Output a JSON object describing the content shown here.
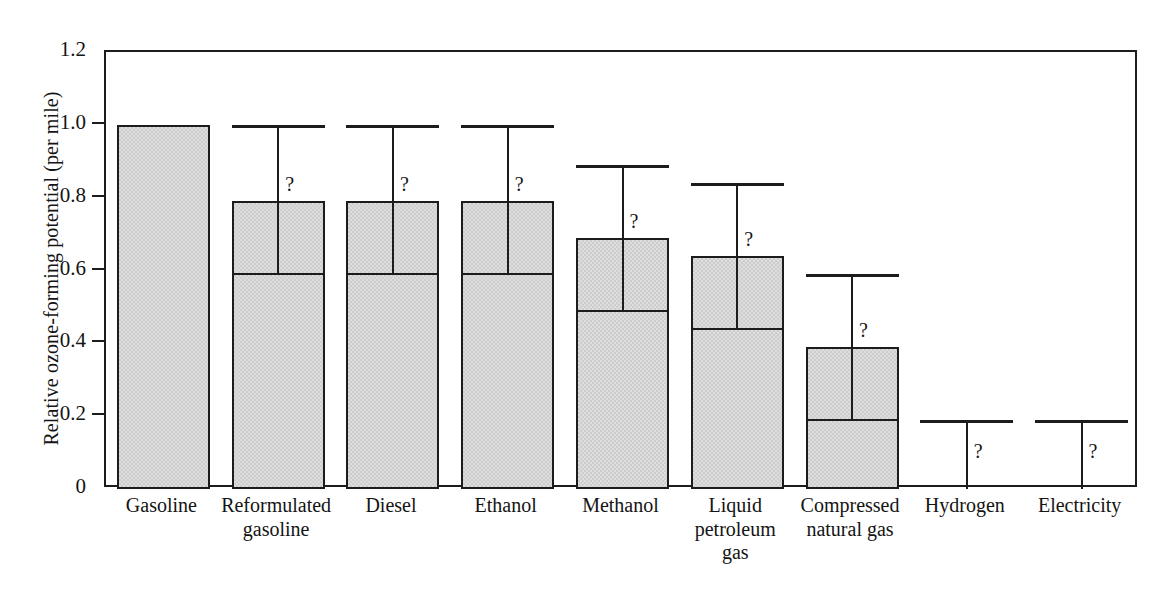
{
  "chart_data": {
    "type": "bar",
    "title": "",
    "xlabel": "",
    "ylabel": "Relative ozone-forming potential (per mile)",
    "ylim": [
      0,
      1.2
    ],
    "grid": false,
    "legend": null,
    "y_ticks": [
      "0",
      "0.2",
      "0.4",
      "0.6",
      "0.8",
      "1.0",
      "1.2"
    ],
    "y_tick_values": [
      0,
      0.2,
      0.4,
      0.6,
      0.8,
      1.0,
      1.2
    ],
    "categories": [
      "Gasoline",
      "Reformulated gasoline",
      "Diesel",
      "Ethanol",
      "Methanol",
      "Liquid petroleum gas",
      "Compressed natural gas",
      "Hydrogen",
      "Electricity"
    ],
    "category_label_lines": [
      [
        "Gasoline"
      ],
      [
        "Reformulated",
        "gasoline"
      ],
      [
        "Diesel"
      ],
      [
        "Ethanol"
      ],
      [
        "Methanol"
      ],
      [
        "Liquid",
        "petroleum",
        "gas"
      ],
      [
        "Compressed",
        "natural gas"
      ],
      [
        "Hydrogen"
      ],
      [
        "Electricity"
      ]
    ],
    "values": [
      1.0,
      0.79,
      0.79,
      0.79,
      0.69,
      0.64,
      0.39,
      0.0,
      0.0
    ],
    "range_low": [
      1.0,
      0.59,
      0.59,
      0.59,
      0.49,
      0.44,
      0.19,
      0.0,
      0.0
    ],
    "range_high": [
      1.0,
      1.0,
      1.0,
      1.0,
      0.89,
      0.84,
      0.59,
      0.19,
      0.19
    ],
    "uncertain_flags": [
      false,
      true,
      true,
      true,
      true,
      true,
      true,
      true,
      true
    ],
    "uncertain_marker": "?",
    "series": [
      {
        "name": "Relative ozone-forming potential (per mile)",
        "values": [
          1.0,
          0.79,
          0.79,
          0.79,
          0.69,
          0.64,
          0.39,
          0.0,
          0.0
        ]
      }
    ],
    "bars": [
      {
        "category": "Gasoline",
        "value": 1.0,
        "low": 1.0,
        "high": 1.0,
        "uncertain": false,
        "marker": ""
      },
      {
        "category": "Reformulated gasoline",
        "value": 0.79,
        "low": 0.59,
        "high": 1.0,
        "uncertain": true,
        "marker": "?"
      },
      {
        "category": "Diesel",
        "value": 0.79,
        "low": 0.59,
        "high": 1.0,
        "uncertain": true,
        "marker": "?"
      },
      {
        "category": "Ethanol",
        "value": 0.79,
        "low": 0.59,
        "high": 1.0,
        "uncertain": true,
        "marker": "?"
      },
      {
        "category": "Methanol",
        "value": 0.69,
        "low": 0.49,
        "high": 0.89,
        "uncertain": true,
        "marker": "?"
      },
      {
        "category": "Liquid petroleum gas",
        "value": 0.64,
        "low": 0.44,
        "high": 0.84,
        "uncertain": true,
        "marker": "?"
      },
      {
        "category": "Compressed natural gas",
        "value": 0.39,
        "low": 0.19,
        "high": 0.59,
        "uncertain": true,
        "marker": "?"
      },
      {
        "category": "Hydrogen",
        "value": 0.0,
        "low": 0.0,
        "high": 0.19,
        "uncertain": true,
        "marker": "?"
      },
      {
        "category": "Electricity",
        "value": 0.0,
        "low": 0.0,
        "high": 0.19,
        "uncertain": true,
        "marker": "?"
      }
    ],
    "colors": {
      "bar_fill": "#cdcdcd",
      "bar_outline": "#1c1c1c",
      "axis": "#1c1c1c",
      "text": "#141414",
      "background": "#ffffff"
    }
  }
}
